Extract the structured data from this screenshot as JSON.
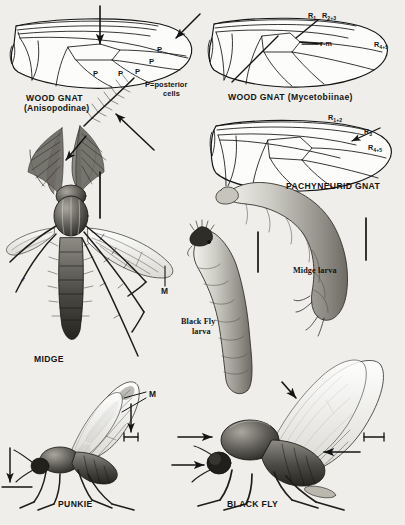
{
  "plate": {
    "background_color": "#efeeea",
    "ink_color": "#141414",
    "subject": "Diptera wing venation and body illustrations"
  },
  "figures": {
    "wood_gnat_anisopodinae": {
      "caption_line1": "WOOD GNAT",
      "caption_line2": "(Anisopodinae)",
      "posterior_cell_marks": [
        "P",
        "P",
        "P",
        "P",
        "P"
      ],
      "legend_line1": "P=posterior",
      "legend_line2": "cells"
    },
    "wood_gnat_mycetobiinae": {
      "caption": "WOOD GNAT (Mycetobiinae)",
      "vein_labels": [
        {
          "name": "R1",
          "base": "R",
          "sub": "1"
        },
        {
          "name": "R2+3",
          "base": "R",
          "sub": "2+3"
        },
        {
          "name": "r-m",
          "base": "r-m",
          "sub": ""
        },
        {
          "name": "R4+5",
          "base": "R",
          "sub": "4+5"
        }
      ]
    },
    "pachyneurid_gnat": {
      "caption": "PACHYNEURID GNAT",
      "vein_labels": [
        {
          "name": "R1+2",
          "base": "R",
          "sub": "1+2"
        },
        {
          "name": "R3",
          "base": "R",
          "sub": "3"
        },
        {
          "name": "R4+5",
          "base": "R",
          "sub": "4+5"
        }
      ]
    },
    "midge": {
      "caption": "MIDGE",
      "sex_symbol": "♂",
      "vein_label": "M"
    },
    "midge_larva": {
      "caption": "Midge larva"
    },
    "black_fly_larva": {
      "caption_line1": "Black Fly",
      "caption_line2": "larva"
    },
    "punkie": {
      "caption": "PUNKIE",
      "vein_label": "M"
    },
    "black_fly": {
      "caption": "BLACK FLY"
    }
  }
}
